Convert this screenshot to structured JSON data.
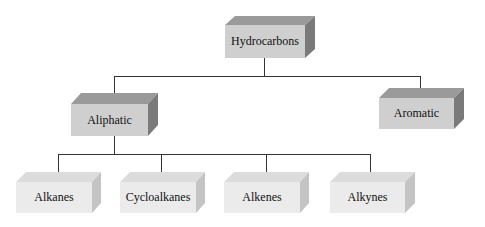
{
  "diagram": {
    "root": {
      "label": "Hydrocarbons"
    },
    "level1": [
      {
        "label": "Aliphatic"
      },
      {
        "label": "Aromatic"
      }
    ],
    "level2": [
      {
        "label": "Alkanes"
      },
      {
        "label": "Cycloalkanes"
      },
      {
        "label": "Alkenes"
      },
      {
        "label": "Alkynes"
      }
    ]
  },
  "colors": {
    "dark_top": "#9a9a9a",
    "dark_front": "#cfcfcf",
    "dark_side": "#7a7a7a",
    "light_top": "#dcdcdc",
    "light_front": "#ebebeb",
    "light_side": "#c4c4c4",
    "line": "#333333"
  }
}
